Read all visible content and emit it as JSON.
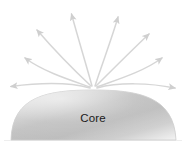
{
  "figure": {
    "background_color": "#ffffff"
  },
  "core": {
    "label": "Core",
    "shape": "dome",
    "fill_light": "#f7f7f7",
    "fill_dark": "#b4b4b4",
    "edge_color": "#c9c9c9",
    "label_color": "#1a1a1a",
    "apex": {
      "x": 93,
      "y": 90
    },
    "base": {
      "left_x": 11,
      "right_x": 176,
      "y": 140
    }
  },
  "arrows": {
    "color": "#d4d4d4",
    "head_color": "#cfcfcf",
    "count": 8,
    "origin": {
      "x": 93,
      "y": 88
    },
    "items": [
      {
        "name": "arrow-far-left",
        "direction": "left",
        "tip_x": 6,
        "tip_y": 86
      },
      {
        "name": "arrow-upper-left",
        "direction": "up-left-low",
        "tip_x": 20,
        "tip_y": 55
      },
      {
        "name": "arrow-steep-left",
        "direction": "up-left-steep",
        "tip_x": 33,
        "tip_y": 26
      },
      {
        "name": "arrow-vertical-left",
        "direction": "up-left-near-vertical",
        "tip_x": 70,
        "tip_y": 9
      },
      {
        "name": "arrow-vertical-right",
        "direction": "up-right-near-vertical",
        "tip_x": 119,
        "tip_y": 12
      },
      {
        "name": "arrow-steep-right",
        "direction": "up-right-steep",
        "tip_x": 152,
        "tip_y": 30
      },
      {
        "name": "arrow-upper-right",
        "direction": "up-right-low",
        "tip_x": 166,
        "tip_y": 55
      },
      {
        "name": "arrow-far-right",
        "direction": "right",
        "tip_x": 180,
        "tip_y": 88
      }
    ]
  },
  "baseline": {
    "name": "ground-line",
    "color": "#e8e8e8"
  }
}
